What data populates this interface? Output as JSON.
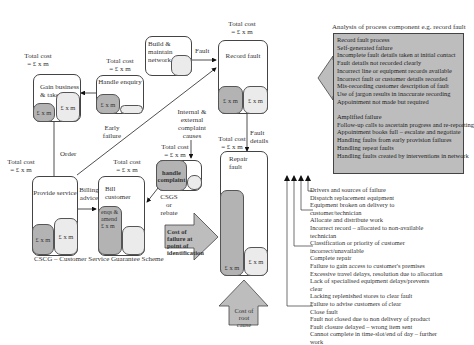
{
  "processes": {
    "gain_business": {
      "title": "Gain business & take order",
      "cost": "Total cost\n= £ x m",
      "cells": [
        "£ x m",
        "£ x m"
      ]
    },
    "handle_enquiry": {
      "title": "Handle enquiry",
      "cost": "Total cost\n= £ x m",
      "cells": [
        "£ x m",
        ""
      ]
    },
    "build_network": {
      "title": "Build & maintain network"
    },
    "record_fault": {
      "title": "Record fault",
      "cost": "Total cost\n= £ x m",
      "cells": [
        "£ x m",
        "£ x m"
      ]
    },
    "provide_service": {
      "title": "Provide service",
      "cost": "Total cost\n= £ x m",
      "cells": [
        "£ x m",
        "£ x m"
      ]
    },
    "bill_customer": {
      "title": "Bill customer",
      "cost": "Total cost\n= £ x m",
      "cells": [
        "enqs & amend £ x m",
        ""
      ]
    },
    "handle_complaint": {
      "title": "handle complaint",
      "cost": "Total cost\n= £ x m"
    },
    "repair_fault": {
      "title": "Repair fault",
      "cost": "Total cost\n= £ x m",
      "cells": [
        "£ x m",
        "£ x m"
      ]
    }
  },
  "flow_labels": {
    "fault": "Fault",
    "order": "Order",
    "early_failure": "Early failure",
    "billing_advice": "Billing advice",
    "complaint_causes": "Internal & external complaint causes",
    "fault_details": "Fault details",
    "csgs": "CSGS or rebate"
  },
  "callouts": {
    "cost_failure": "Cost of failure at point of identification",
    "cost_root": "Cost of root cause"
  },
  "footnote": "CSCG – Customer Service Guarantee Scheme",
  "analysis": {
    "heading": "Analysis of process component e.g. record fault",
    "items": [
      "Record fault process",
      "Self-generated failure",
      "Incomplete fault details taken at initial contact",
      "Fault details not recorded clearly",
      "Incorrect line or equipment records available",
      "Incorrect fault or customer details recorded",
      "Mis-recording customer description of fault",
      "Use of jargon results in inaccurate recording",
      "Appointment not made but required",
      "",
      "Amplified failure",
      "Follow-up calls to ascertain progress and re-reporting",
      "Appointment books full – escalate and negotiate",
      "Handling faults from early provision failures",
      "Handling repeat faults",
      "Handling faults created by interventions in network"
    ]
  },
  "root_causes": [
    "Drivers and sources of failure",
    "Dispatch replacement equipment",
    "Equipment broken on delivery to",
    "customer/technician",
    "Allocate and distribute work",
    "Incorrect record – allocated to non-available",
    "technician",
    "Classification or priority of customer",
    "incorrect/unavailable",
    "Complete repair",
    "Failure to gain access to customer's premises",
    "Excessive travel delays, resolution due to allocation",
    "Lack of specialised equipment delays/prevents",
    "clear",
    "Lacking replenished stores to clear fault",
    "Failure to advise customers of clear",
    "Close fault",
    "Fault not closed due to non delivery of product",
    "Fault closure delayed – wrong item sent",
    "Cannot complete in time-slot/end of day – further",
    "work"
  ]
}
